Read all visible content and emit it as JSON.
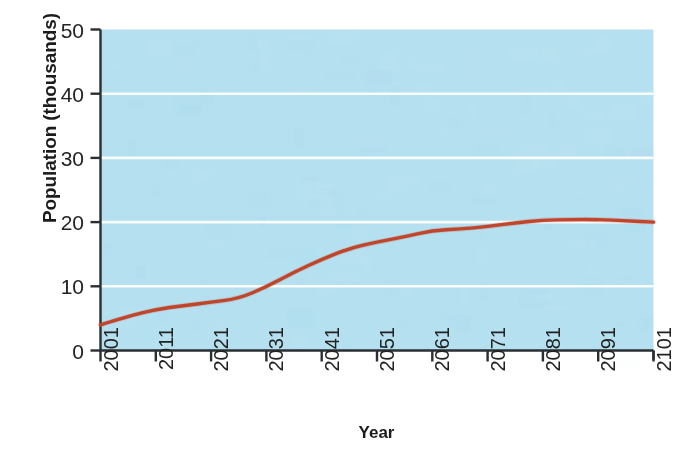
{
  "figure": {
    "background_color": "#ffffff",
    "plot_background_color": "#b5e0f0",
    "gridline_color": "#ffffff",
    "axis_color": "#2a2f33",
    "line_color": "#c0452a",
    "top_clipped_text": "·",
    "bottom_clipped_text": "·"
  },
  "axes": {
    "ylabel": "Population (thousands)",
    "xlabel": "Year"
  },
  "chart_data": {
    "type": "line",
    "title": "",
    "subtitle": "",
    "xlabel": "Year",
    "ylabel": "Population (thousands)",
    "xlim": [
      2001,
      2101
    ],
    "ylim": [
      0,
      50
    ],
    "xticks": [
      2001,
      2011,
      2021,
      2031,
      2041,
      2051,
      2061,
      2071,
      2081,
      2091,
      2101
    ],
    "xticklabels": [
      "2001",
      "2011",
      "2021",
      "2031",
      "2041",
      "2051",
      "2061",
      "2071",
      "2081",
      "2091",
      "2101"
    ],
    "yticks": [
      0,
      10,
      20,
      30,
      40,
      50
    ],
    "yticklabels": [
      "0",
      "10",
      "20",
      "30",
      "40",
      "50"
    ],
    "grid": "horizontal",
    "gridline_values": [
      10,
      20,
      30,
      40
    ],
    "legend": null,
    "legend_position": "none",
    "annotations": [],
    "series": [
      {
        "name": "Projected population",
        "color": "#c0452a",
        "linewidth": 3.4,
        "x": [
          2001,
          2006,
          2011,
          2016,
          2021,
          2026,
          2031,
          2036,
          2041,
          2046,
          2051,
          2056,
          2061,
          2066,
          2071,
          2076,
          2081,
          2086,
          2091,
          2096,
          2101
        ],
        "values": [
          4.0,
          5.3,
          6.4,
          7.0,
          7.5,
          8.1,
          9.9,
          12.2,
          14.2,
          15.9,
          16.9,
          17.7,
          18.7,
          18.9,
          19.3,
          19.9,
          20.3,
          20.4,
          20.4,
          20.2,
          20.0
        ]
      }
    ]
  }
}
